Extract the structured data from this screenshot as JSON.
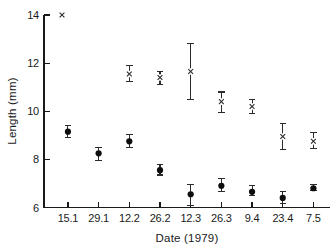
{
  "chart_data": {
    "type": "scatter",
    "title": "",
    "xlabel": "Date (1979)",
    "ylabel": "Length (mm)",
    "categories": [
      "15.1",
      "29.1",
      "12.2",
      "26.2",
      "12.3",
      "26.3",
      "9.4",
      "23.4",
      "7.5"
    ],
    "ylim": [
      6,
      14
    ],
    "yticks": [
      6,
      8,
      10,
      12,
      14
    ],
    "yticklabels": [
      "6",
      "8",
      "10",
      "12",
      "14"
    ],
    "grid": false,
    "legend": "none",
    "series": [
      {
        "name": "cross-series",
        "marker": "x",
        "color": "#2b2b2b",
        "points": [
          {
            "x": "15.1",
            "y": null,
            "err_low": null,
            "err_high": null
          },
          {
            "x": "29.1",
            "y": null,
            "err_low": null,
            "err_high": null
          },
          {
            "x": "12.2",
            "y": 11.55,
            "err_low": 11.25,
            "err_high": 11.9
          },
          {
            "x": "26.2",
            "y": 11.4,
            "err_low": 11.1,
            "err_high": 11.65
          },
          {
            "x": "12.3",
            "y": 11.65,
            "err_low": 10.5,
            "err_high": 12.8
          },
          {
            "x": "26.3",
            "y": 10.4,
            "err_low": 9.95,
            "err_high": 10.8
          },
          {
            "x": "9.4",
            "y": 10.2,
            "err_low": 9.9,
            "err_high": 10.5
          },
          {
            "x": "23.4",
            "y": 8.95,
            "err_low": 8.4,
            "err_high": 9.5
          },
          {
            "x": "7.5",
            "y": 8.75,
            "err_low": 8.45,
            "err_high": 9.1
          }
        ]
      },
      {
        "name": "dot-series",
        "marker": "filled-circle",
        "color": "#0d0d0d",
        "points": [
          {
            "x": "15.1",
            "y": 9.15,
            "err_low": 8.9,
            "err_high": 9.4
          },
          {
            "x": "29.1",
            "y": 8.25,
            "err_low": 7.95,
            "err_high": 8.5
          },
          {
            "x": "12.2",
            "y": 8.75,
            "err_low": 8.5,
            "err_high": 9.05
          },
          {
            "x": "26.2",
            "y": 7.55,
            "err_low": 7.35,
            "err_high": 7.8
          },
          {
            "x": "12.3",
            "y": 6.55,
            "err_low": 6.1,
            "err_high": 6.95
          },
          {
            "x": "26.3",
            "y": 6.9,
            "err_low": 6.65,
            "err_high": 7.2
          },
          {
            "x": "9.4",
            "y": 6.65,
            "err_low": 6.5,
            "err_high": 6.9
          },
          {
            "x": "23.4",
            "y": 6.4,
            "err_low": 6.15,
            "err_high": 6.65
          },
          {
            "x": "7.5",
            "y": 6.8,
            "err_low": 6.7,
            "err_high": 6.95
          }
        ]
      }
    ],
    "annotations": [
      {
        "name": "legend-cross-mark",
        "symbol": "x",
        "x_px": 62,
        "y_px": 15
      }
    ]
  }
}
